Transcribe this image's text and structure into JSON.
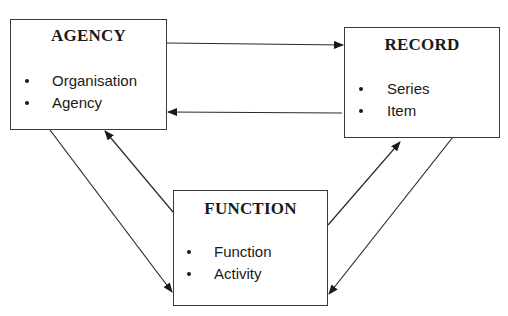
{
  "diagram": {
    "entities": [
      {
        "id": "agency",
        "title": "AGENCY",
        "items": [
          "Organisation",
          "Agency"
        ]
      },
      {
        "id": "record",
        "title": "RECORD",
        "items": [
          "Series",
          "Item"
        ]
      },
      {
        "id": "function",
        "title": "FUNCTION",
        "items": [
          "Function",
          "Activity"
        ]
      }
    ],
    "relationships": [
      {
        "from": "AGENCY",
        "to": "RECORD"
      },
      {
        "from": "RECORD",
        "to": "AGENCY"
      },
      {
        "from": "AGENCY",
        "to": "FUNCTION"
      },
      {
        "from": "FUNCTION",
        "to": "AGENCY"
      },
      {
        "from": "FUNCTION",
        "to": "RECORD"
      },
      {
        "from": "RECORD",
        "to": "FUNCTION"
      }
    ],
    "colors": {
      "line": "#2a2a2a",
      "text": "#1a1a1a",
      "background": "#ffffff"
    }
  }
}
